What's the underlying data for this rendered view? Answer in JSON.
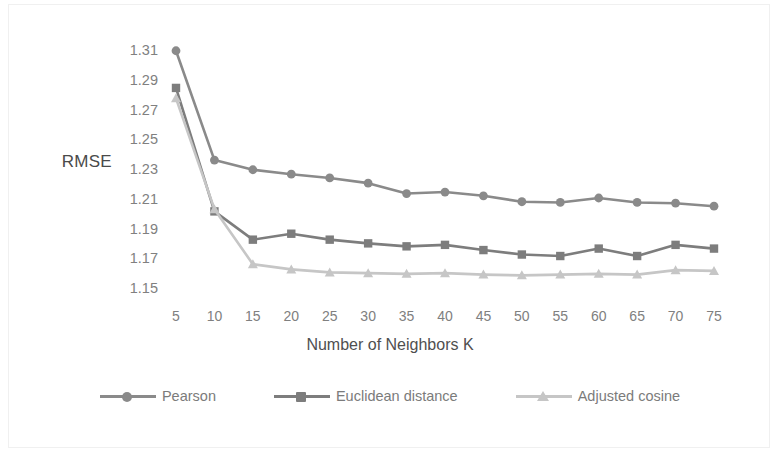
{
  "chart_data": {
    "type": "line",
    "title": "",
    "xlabel": "Number of Neighbors K",
    "ylabel": "RMSE",
    "categories": [
      5,
      10,
      15,
      20,
      25,
      30,
      35,
      40,
      45,
      50,
      55,
      60,
      65,
      70,
      75
    ],
    "x_tick_labels": [
      "5",
      "10",
      "15",
      "20",
      "25",
      "30",
      "35",
      "40",
      "45",
      "50",
      "55",
      "60",
      "65",
      "70",
      "75"
    ],
    "y_tick_labels": [
      "1.31",
      "1.29",
      "1.27",
      "1.25",
      "1.23",
      "1.21",
      "1.19",
      "1.17",
      "1.15"
    ],
    "y_tick_values": [
      1.31,
      1.29,
      1.27,
      1.25,
      1.23,
      1.21,
      1.19,
      1.17,
      1.15
    ],
    "ylim": [
      1.15,
      1.315
    ],
    "xlim": [
      5,
      75
    ],
    "grid": false,
    "legend_position": "bottom",
    "series": [
      {
        "name": "Pearson",
        "marker": "circle",
        "color": "#8a8a8a",
        "values": [
          1.3095,
          1.236,
          1.2295,
          1.2265,
          1.224,
          1.2205,
          1.2135,
          1.2145,
          1.212,
          1.208,
          1.2075,
          1.2105,
          1.2075,
          1.207,
          1.205
        ]
      },
      {
        "name": "Euclidean distance",
        "marker": "square",
        "color": "#7d7d7d",
        "values": [
          1.2845,
          1.2015,
          1.1825,
          1.1865,
          1.1825,
          1.18,
          1.178,
          1.179,
          1.1755,
          1.1725,
          1.1715,
          1.1765,
          1.1715,
          1.179,
          1.1765
        ]
      },
      {
        "name": "Adjusted cosine",
        "marker": "triangle",
        "color": "#c6c6c6",
        "values": [
          1.2775,
          1.203,
          1.166,
          1.1625,
          1.1605,
          1.16,
          1.1595,
          1.16,
          1.159,
          1.1585,
          1.159,
          1.1595,
          1.159,
          1.162,
          1.1615
        ]
      }
    ]
  },
  "legend": {
    "entries": [
      {
        "label": "Pearson"
      },
      {
        "label": "Euclidean distance"
      },
      {
        "label": "Adjusted cosine"
      }
    ]
  },
  "colors": {
    "pearson": "#8a8a8a",
    "euclidean": "#7d7d7d",
    "adjusted_cosine": "#c6c6c6",
    "tick_text": "#808080",
    "axis_label_text": "#4f4f4f",
    "background": "#ffffff",
    "frame": "#f0f0f0"
  }
}
